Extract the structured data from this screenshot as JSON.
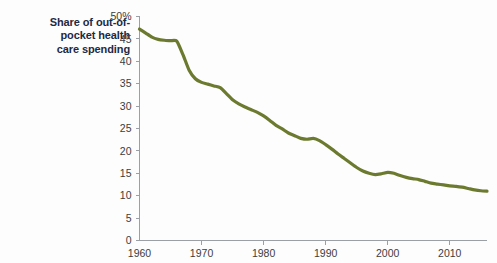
{
  "chart_data": {
    "type": "line",
    "title_lines": [
      "Share of out-of-",
      "pocket health",
      "care spending"
    ],
    "xlabel": "",
    "ylabel": "",
    "xlim": [
      1960,
      2016
    ],
    "ylim": [
      0,
      50
    ],
    "grid": false,
    "legend": false,
    "y_ticks": [
      0,
      5,
      10,
      15,
      20,
      25,
      30,
      35,
      40,
      45,
      50
    ],
    "y_tick_labels": [
      "0",
      "5",
      "10",
      "15",
      "20",
      "25",
      "30",
      "35",
      "40",
      "45",
      "50%"
    ],
    "x_ticks": [
      1960,
      1970,
      1980,
      1990,
      2000,
      2010
    ],
    "x_tick_labels": [
      "1960",
      "1970",
      "1980",
      "1990",
      "2000",
      "2010"
    ],
    "series": [
      {
        "name": "Share of out-of-pocket health care spending",
        "color": "#6b7a2e",
        "line_width": 3.2,
        "x": [
          1960,
          1961,
          1962,
          1963,
          1964,
          1965,
          1966,
          1967,
          1968,
          1969,
          1970,
          1971,
          1972,
          1973,
          1974,
          1975,
          1976,
          1977,
          1978,
          1979,
          1980,
          1981,
          1982,
          1983,
          1984,
          1985,
          1986,
          1987,
          1988,
          1989,
          1990,
          1991,
          1992,
          1993,
          1994,
          1995,
          1996,
          1997,
          1998,
          1999,
          2000,
          2001,
          2002,
          2003,
          2004,
          2005,
          2006,
          2007,
          2008,
          2009,
          2010,
          2011,
          2012,
          2013,
          2014,
          2015,
          2016
        ],
        "y": [
          47.2,
          46.3,
          45.4,
          44.9,
          44.7,
          44.6,
          44.5,
          41.5,
          38.0,
          36.1,
          35.3,
          34.9,
          34.5,
          34.1,
          32.8,
          31.4,
          30.5,
          29.8,
          29.2,
          28.6,
          27.8,
          26.8,
          25.7,
          24.9,
          24.0,
          23.4,
          22.8,
          22.6,
          22.8,
          22.3,
          21.4,
          20.4,
          19.3,
          18.3,
          17.3,
          16.3,
          15.5,
          15.0,
          14.7,
          14.9,
          15.2,
          15.0,
          14.5,
          14.1,
          13.8,
          13.6,
          13.2,
          12.8,
          12.6,
          12.4,
          12.2,
          12.1,
          11.9,
          11.6,
          11.3,
          11.1,
          11.0
        ]
      }
    ]
  }
}
